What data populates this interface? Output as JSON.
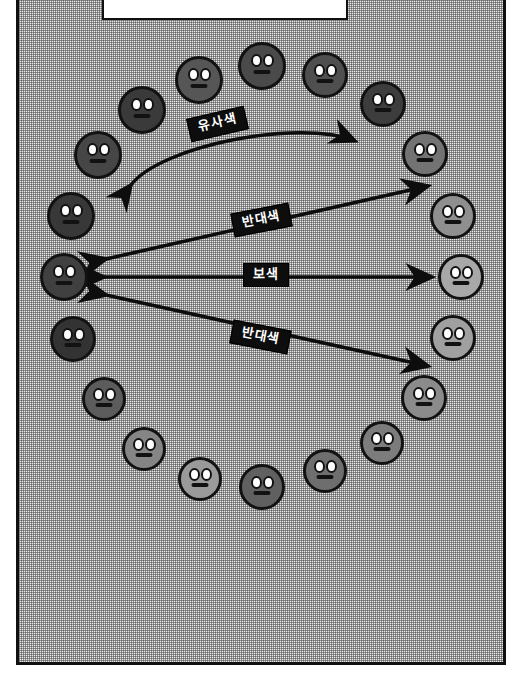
{
  "diagram": {
    "panel": {
      "border_color": "#111111",
      "fill": "#e9e9e9"
    },
    "caption_box": {
      "text": "",
      "fill": "#ffffff",
      "border_color": "#111111"
    },
    "labels": [
      {
        "id": "analogous",
        "text": "유사색",
        "x": 188,
        "y": 112,
        "rotate": -13
      },
      {
        "id": "contrast-top",
        "text": "반대색",
        "x": 232,
        "y": 208,
        "rotate": -11
      },
      {
        "id": "complementary",
        "text": "보색",
        "x": 243,
        "y": 263,
        "rotate": 0
      },
      {
        "id": "contrast-bot",
        "text": "반대색",
        "x": 231,
        "y": 325,
        "rotate": 11
      }
    ],
    "wheel": {
      "count": 20,
      "note": "색상환 – 어두운 색에서 밝은 색으로 이어지는 20개 얼굴 원",
      "faces": [
        {
          "i": 0,
          "cx": 262,
          "cy": 66,
          "r": 24,
          "color": "#4a4a4a"
        },
        {
          "i": 1,
          "cx": 325,
          "cy": 75,
          "r": 23,
          "color": "#4f4f4f"
        },
        {
          "i": 2,
          "cx": 383,
          "cy": 104,
          "r": 23,
          "color": "#3d3d3d"
        },
        {
          "i": 3,
          "cx": 425,
          "cy": 154,
          "r": 23,
          "color": "#737373"
        },
        {
          "i": 4,
          "cx": 453,
          "cy": 216,
          "r": 23,
          "color": "#8f8f8f"
        },
        {
          "i": 5,
          "cx": 461,
          "cy": 277,
          "r": 23,
          "color": "#a8a8a8"
        },
        {
          "i": 6,
          "cx": 453,
          "cy": 338,
          "r": 23,
          "color": "#a0a0a0"
        },
        {
          "i": 7,
          "cx": 424,
          "cy": 398,
          "r": 23,
          "color": "#8b8b8b"
        },
        {
          "i": 8,
          "cx": 382,
          "cy": 443,
          "r": 22,
          "color": "#7c7c7c"
        },
        {
          "i": 9,
          "cx": 325,
          "cy": 471,
          "r": 22,
          "color": "#6e6e6e"
        },
        {
          "i": 10,
          "cx": 262,
          "cy": 487,
          "r": 23,
          "color": "#606060"
        },
        {
          "i": 11,
          "cx": 200,
          "cy": 479,
          "r": 22,
          "color": "#9a9a9a"
        },
        {
          "i": 12,
          "cx": 144,
          "cy": 449,
          "r": 22,
          "color": "#858585"
        },
        {
          "i": 13,
          "cx": 104,
          "cy": 399,
          "r": 22,
          "color": "#5c5c5c"
        },
        {
          "i": 14,
          "cx": 73,
          "cy": 339,
          "r": 23,
          "color": "#333333"
        },
        {
          "i": 15,
          "cx": 64,
          "cy": 277,
          "r": 24,
          "color": "#404040"
        },
        {
          "i": 16,
          "cx": 71,
          "cy": 216,
          "r": 24,
          "color": "#383838"
        },
        {
          "i": 17,
          "cx": 98,
          "cy": 155,
          "r": 24,
          "color": "#464646"
        },
        {
          "i": 18,
          "cx": 142,
          "cy": 110,
          "r": 24,
          "color": "#3a3a3a"
        },
        {
          "i": 19,
          "cx": 199,
          "cy": 80,
          "r": 24,
          "color": "#565656"
        }
      ]
    },
    "relations": [
      {
        "id": "analogous-arc",
        "label": "유사색",
        "kind": "curved-double",
        "from": "face-17",
        "to": "face-3"
      },
      {
        "id": "contrast-upper",
        "label": "반대색",
        "kind": "straight-double",
        "from": "face-15",
        "to": "face-4"
      },
      {
        "id": "complementary",
        "label": "보색",
        "kind": "straight-double",
        "from": "face-15",
        "to": "face-5"
      },
      {
        "id": "contrast-lower",
        "label": "반대색",
        "kind": "straight-double",
        "from": "face-15",
        "to": "face-6"
      }
    ]
  }
}
